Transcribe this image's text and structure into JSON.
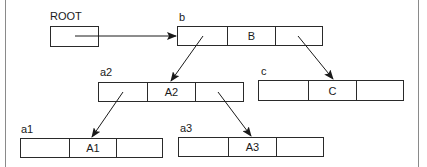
{
  "diagram": {
    "type": "linked-tree-structure",
    "root": {
      "label": "ROOT",
      "points_to": "b"
    },
    "nodes": [
      {
        "id": "b",
        "label": "b",
        "cells": [
          "",
          "B",
          ""
        ],
        "left_child": "a2",
        "right_child": "c"
      },
      {
        "id": "a2",
        "label": "a2",
        "cells": [
          "",
          "A2",
          ""
        ],
        "left_child": "a1",
        "right_child": "a3"
      },
      {
        "id": "c",
        "label": "c",
        "cells": [
          "",
          "C",
          ""
        ]
      },
      {
        "id": "a1",
        "label": "a1",
        "cells": [
          "",
          "A1",
          ""
        ]
      },
      {
        "id": "a3",
        "label": "a3",
        "cells": [
          "",
          "A3",
          ""
        ]
      }
    ],
    "edges": [
      {
        "from": "ROOT",
        "to": "b"
      },
      {
        "from": "b.left",
        "to": "a2"
      },
      {
        "from": "b.right",
        "to": "c"
      },
      {
        "from": "a2.left",
        "to": "a1"
      },
      {
        "from": "a2.right",
        "to": "a3"
      }
    ],
    "colors": {
      "line": "#2a2a2a",
      "frame": "#8a8a8a",
      "background": "#ffffff"
    }
  }
}
